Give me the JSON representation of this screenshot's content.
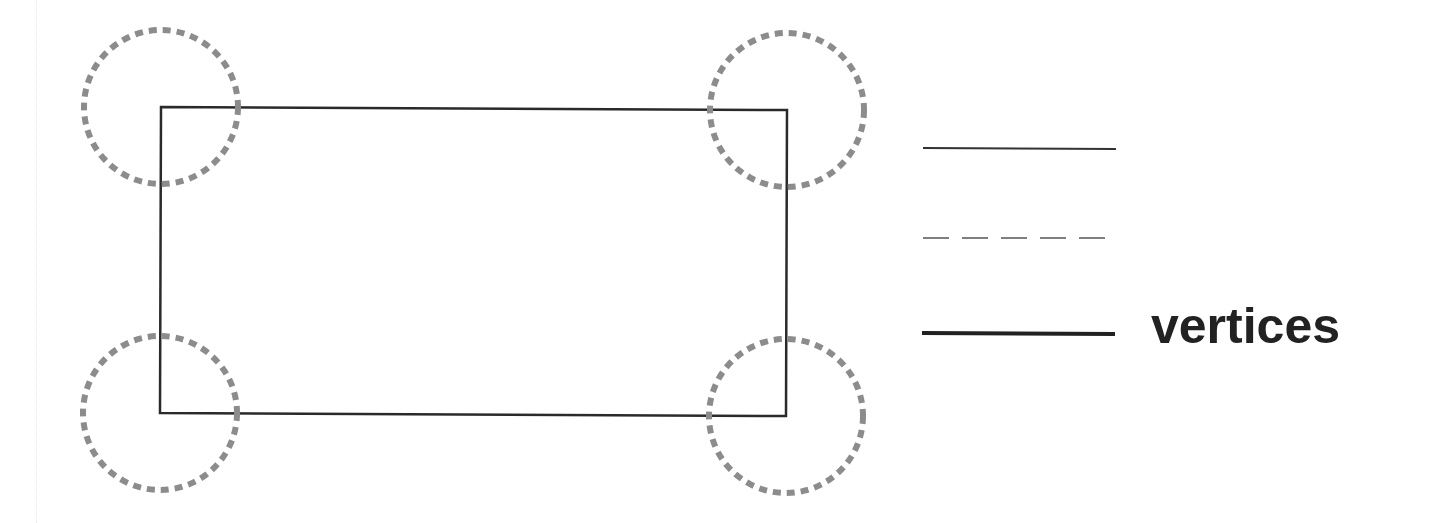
{
  "diagram": {
    "rectangle": {
      "corners": {
        "top_left": [
          161,
          107
        ],
        "top_right": [
          787,
          110
        ],
        "bottom_right": [
          786,
          416
        ],
        "bottom_left": [
          160,
          413
        ]
      },
      "stroke_color": "#2a2a2a",
      "stroke_width": 2.5
    },
    "vertex_markers": {
      "shape": "dashed-circle",
      "radius": 77,
      "stroke_color": "#8c8c8c",
      "stroke_width": 6,
      "centers": [
        [
          161,
          107
        ],
        [
          787,
          110
        ],
        [
          160,
          413
        ],
        [
          786,
          416
        ]
      ]
    },
    "legend": {
      "items": [
        {
          "style": "solid",
          "stroke_width": 2,
          "label": ""
        },
        {
          "style": "dashed",
          "stroke_width": 1.5,
          "label": ""
        },
        {
          "style": "solid-thick",
          "stroke_width": 4,
          "label": "vertices"
        }
      ]
    }
  }
}
